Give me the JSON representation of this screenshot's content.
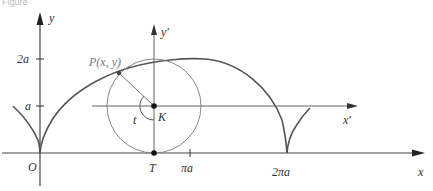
{
  "figure": {
    "caption_fragment": "Figure",
    "colors": {
      "axis": "#444444",
      "curve": "#555555",
      "circle": "#888888",
      "label": "#333333",
      "label_grey": "#777777"
    }
  },
  "axes": {
    "x_label": "x",
    "y_label": "y",
    "origin_label": "O",
    "x_ticks": [
      "πa",
      "2πa"
    ],
    "y_ticks": [
      "a",
      "2a"
    ]
  },
  "rolling_circle": {
    "center_label": "K",
    "contact_label": "T",
    "angle_label": "t",
    "point_label": "P(x, y)",
    "local_x_label": "x′",
    "local_y_label": "y′"
  }
}
